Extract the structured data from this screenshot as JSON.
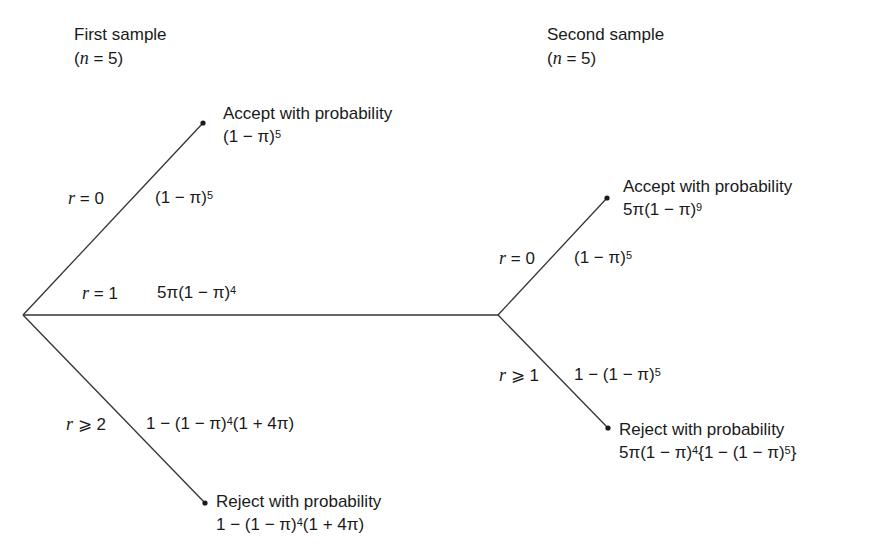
{
  "stage1": {
    "title": "First sample",
    "n_label": "(n = 5)",
    "n_var": "n",
    "n_eq": " = 5)",
    "n_open": "("
  },
  "stage2": {
    "title": "Second sample",
    "n_label": "(n = 5)",
    "n_var": "n",
    "n_eq": " = 5)",
    "n_open": "("
  },
  "first_branches": {
    "r0": {
      "cond_var": "r",
      "cond": " = 0",
      "prob": "(1 − π)",
      "prob_exp": "5"
    },
    "r1": {
      "cond_var": "r",
      "cond": " = 1",
      "prob": "5π(1 − π)",
      "prob_exp": "4"
    },
    "r2": {
      "cond_var": "r",
      "cond": " ⩾ 2",
      "prob_a": "1 − (1 − π)",
      "prob_exp": "4",
      "prob_b": "(1 + 4π)"
    }
  },
  "first_outcomes": {
    "accept": {
      "label": "Accept with probability",
      "expr": "(1 − π)",
      "expr_exp": "5"
    },
    "reject": {
      "label": "Reject with probability",
      "expr_a": "1 − (1 − π)",
      "expr_exp": "4",
      "expr_b": "(1 + 4π)"
    }
  },
  "second_branches": {
    "r0": {
      "cond_var": "r",
      "cond": " = 0",
      "prob": "(1 − π)",
      "prob_exp": "5"
    },
    "r1": {
      "cond_var": "r",
      "cond": " ⩾ 1",
      "prob": "1 − (1 − π)",
      "prob_exp": "5"
    }
  },
  "second_outcomes": {
    "accept": {
      "label": "Accept with probability",
      "expr": "5π(1 − π)",
      "expr_exp": "9"
    },
    "reject": {
      "label": "Reject with probability",
      "expr_a": "5π(1 − π)",
      "expr_exp1": "4",
      "expr_b": "{1 − (1 − π)",
      "expr_exp2": "5",
      "expr_c": "}"
    }
  },
  "colors": {
    "line": "#333333",
    "text": "#1a1a1a",
    "background": "#ffffff"
  }
}
